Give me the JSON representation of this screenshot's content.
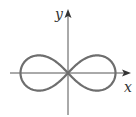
{
  "figure": {
    "x_axis_label": "x",
    "y_axis_label": "y",
    "colors": {
      "axis": "#555555",
      "curve": "#6e6e6e",
      "label": "#333333",
      "background": "#ffffff"
    }
  },
  "chart_data": {
    "type": "line",
    "title": "",
    "xlabel": "x",
    "ylabel": "y",
    "curve": "lemniscate",
    "equation": "(x^2 + y^2)^2 = a^2 (x^2 - y^2)",
    "parametric_note": "symmetric figure-eight, crossing at origin, two lobes along x-axis",
    "grid": false,
    "legend": null,
    "ticks": []
  }
}
